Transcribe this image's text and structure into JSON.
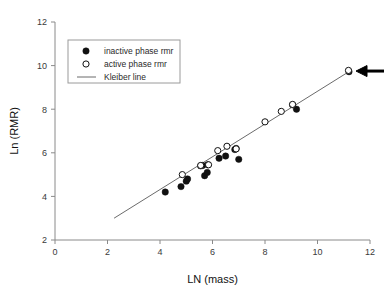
{
  "chart_data": {
    "type": "scatter",
    "title": "",
    "xlabel": "LN (mass)",
    "ylabel": "Ln (RMR)",
    "xlim": [
      0,
      12
    ],
    "ylim": [
      2,
      12
    ],
    "xticks": [
      0,
      2,
      4,
      6,
      8,
      10,
      12
    ],
    "yticks": [
      2,
      4,
      6,
      8,
      10,
      12
    ],
    "grid": false,
    "legend_position": "upper-left",
    "legend": [
      {
        "key": "inactive",
        "label": "inactive phase rmr",
        "marker": "filled-circle",
        "color": "#111111"
      },
      {
        "key": "active",
        "label": "active phase rmr",
        "marker": "open-circle",
        "color": "#111111"
      },
      {
        "key": "kleiber",
        "label": "Kleiber line",
        "marker": "line",
        "color": "#6b6b6b"
      }
    ],
    "series": [
      {
        "name": "inactive phase rmr",
        "marker": "filled-circle",
        "points": [
          [
            4.2,
            4.2
          ],
          [
            4.8,
            4.45
          ],
          [
            5.0,
            4.7
          ],
          [
            5.05,
            4.8
          ],
          [
            5.55,
            5.4
          ],
          [
            5.62,
            5.42
          ],
          [
            5.7,
            4.95
          ],
          [
            5.8,
            5.1
          ],
          [
            5.82,
            5.45
          ],
          [
            6.25,
            5.75
          ],
          [
            6.5,
            5.85
          ],
          [
            6.85,
            6.15
          ],
          [
            6.9,
            6.2
          ],
          [
            7.0,
            5.7
          ],
          [
            9.2,
            8.0
          ],
          [
            9.05,
            8.2
          ],
          [
            11.2,
            9.72
          ]
        ]
      },
      {
        "name": "active phase rmr",
        "marker": "open-circle",
        "points": [
          [
            4.85,
            5.0
          ],
          [
            5.55,
            5.42
          ],
          [
            5.85,
            5.45
          ],
          [
            6.2,
            6.1
          ],
          [
            6.55,
            6.3
          ],
          [
            6.9,
            6.18
          ],
          [
            8.0,
            7.42
          ],
          [
            8.62,
            7.9
          ],
          [
            9.05,
            8.22
          ],
          [
            11.18,
            9.78
          ]
        ]
      }
    ],
    "fit_line": {
      "name": "Kleiber line",
      "x_start": 2.25,
      "y_start": 3.0,
      "x_end": 11.3,
      "y_end": 9.8
    },
    "annotations": [
      {
        "type": "arrow",
        "label": "",
        "points_to_x": 11.2,
        "points_to_y": 9.75,
        "direction": "left"
      }
    ]
  }
}
